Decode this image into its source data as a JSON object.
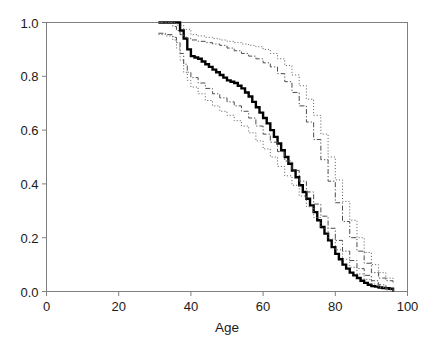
{
  "chart_data": {
    "type": "line",
    "title": "",
    "subtitle": "",
    "xlabel": "Age",
    "ylabel": "",
    "xlim": [
      0,
      100
    ],
    "ylim": [
      0.0,
      1.0
    ],
    "xticks": [
      "0",
      "20",
      "40",
      "60",
      "80",
      "100"
    ],
    "xtick_values": [
      0,
      20,
      40,
      60,
      80,
      100
    ],
    "yticks": [
      "0.0",
      "0.2",
      "0.4",
      "0.6",
      "0.8",
      "1.0"
    ],
    "ytick_values": [
      0.0,
      0.2,
      0.4,
      0.6,
      0.8,
      1.0
    ],
    "grid": false,
    "legend": "none",
    "frame": "box",
    "step_type": "post",
    "colors": {
      "axis": "#808080",
      "estimate": "#000000",
      "band_inner": "#4d4d4d",
      "band_outer": "#666666",
      "background": "#ffffff",
      "text": "#1a1a1a"
    },
    "series": [
      {
        "name": "estimate",
        "style": "solid",
        "width": 2.4,
        "x": [
          31,
          36,
          37,
          38,
          39,
          40,
          41,
          42,
          43,
          44,
          45,
          46,
          47,
          48,
          49,
          50,
          51,
          52,
          53,
          54,
          55,
          56,
          57,
          58,
          59,
          60,
          61,
          62,
          63,
          64,
          65,
          66,
          67,
          68,
          69,
          70,
          71,
          72,
          73,
          74,
          75,
          76,
          77,
          78,
          79,
          80,
          81,
          82,
          83,
          84,
          85,
          86,
          87,
          88,
          89,
          90,
          91,
          92,
          93,
          94,
          95,
          96
        ],
        "y": [
          1.0,
          1.0,
          0.97,
          0.94,
          0.9,
          0.875,
          0.87,
          0.865,
          0.855,
          0.845,
          0.835,
          0.825,
          0.815,
          0.805,
          0.795,
          0.785,
          0.78,
          0.775,
          0.765,
          0.755,
          0.74,
          0.725,
          0.705,
          0.685,
          0.665,
          0.645,
          0.625,
          0.6,
          0.575,
          0.55,
          0.525,
          0.5,
          0.475,
          0.45,
          0.425,
          0.395,
          0.37,
          0.345,
          0.32,
          0.295,
          0.265,
          0.24,
          0.215,
          0.19,
          0.165,
          0.14,
          0.12,
          0.1,
          0.085,
          0.07,
          0.06,
          0.05,
          0.04,
          0.032,
          0.025,
          0.02,
          0.018,
          0.015,
          0.013,
          0.012,
          0.01,
          0.0
        ]
      },
      {
        "name": "upper-inner-band",
        "style": "dashdot",
        "width": 1.0,
        "x": [
          31,
          34,
          35,
          36,
          37,
          38,
          39,
          40,
          42,
          44,
          46,
          48,
          50,
          52,
          54,
          56,
          58,
          60,
          62,
          64,
          66,
          68,
          70,
          72,
          74,
          76,
          78,
          80,
          82,
          84,
          86,
          88,
          90,
          92,
          94,
          96
        ],
        "y": [
          1.0,
          1.0,
          0.985,
          0.97,
          0.955,
          0.945,
          0.94,
          0.935,
          0.93,
          0.925,
          0.92,
          0.915,
          0.905,
          0.895,
          0.885,
          0.875,
          0.865,
          0.85,
          0.835,
          0.81,
          0.78,
          0.74,
          0.69,
          0.63,
          0.565,
          0.49,
          0.41,
          0.33,
          0.26,
          0.2,
          0.15,
          0.105,
          0.07,
          0.05,
          0.04,
          0.03
        ]
      },
      {
        "name": "upper-outer-band",
        "style": "dotted",
        "width": 1.0,
        "x": [
          31,
          34,
          36,
          38,
          40,
          42,
          44,
          46,
          48,
          50,
          52,
          54,
          56,
          58,
          60,
          62,
          64,
          66,
          68,
          70,
          72,
          74,
          76,
          78,
          80,
          82,
          84,
          86,
          88,
          90,
          92,
          94,
          96
        ],
        "y": [
          1.0,
          1.0,
          0.99,
          0.975,
          0.955,
          0.95,
          0.945,
          0.94,
          0.935,
          0.93,
          0.925,
          0.92,
          0.915,
          0.91,
          0.9,
          0.885,
          0.865,
          0.84,
          0.805,
          0.765,
          0.715,
          0.655,
          0.585,
          0.5,
          0.415,
          0.335,
          0.265,
          0.2,
          0.145,
          0.1,
          0.07,
          0.05,
          0.04
        ]
      },
      {
        "name": "lower-inner-band",
        "style": "dashdot",
        "width": 1.0,
        "x": [
          31,
          33,
          35,
          36,
          37,
          38,
          39,
          40,
          42,
          44,
          46,
          48,
          50,
          52,
          54,
          56,
          58,
          60,
          62,
          64,
          66,
          68,
          70,
          72,
          74,
          76,
          78,
          80,
          82,
          84,
          86,
          88,
          90,
          92,
          94,
          96
        ],
        "y": [
          0.96,
          0.955,
          0.945,
          0.925,
          0.885,
          0.845,
          0.815,
          0.795,
          0.775,
          0.755,
          0.735,
          0.72,
          0.705,
          0.69,
          0.67,
          0.645,
          0.615,
          0.585,
          0.555,
          0.52,
          0.485,
          0.45,
          0.41,
          0.37,
          0.325,
          0.28,
          0.235,
          0.19,
          0.15,
          0.115,
          0.085,
          0.06,
          0.04,
          0.025,
          0.012,
          0.0
        ]
      },
      {
        "name": "lower-outer-band",
        "style": "dotted",
        "width": 1.0,
        "x": [
          31,
          33,
          35,
          36,
          37,
          38,
          39,
          40,
          42,
          44,
          46,
          48,
          50,
          52,
          54,
          56,
          58,
          60,
          62,
          64,
          66,
          68,
          70,
          72,
          74,
          76,
          78,
          80,
          82,
          84,
          86,
          88,
          90,
          92,
          94,
          96
        ],
        "y": [
          0.955,
          0.95,
          0.935,
          0.905,
          0.86,
          0.815,
          0.785,
          0.76,
          0.735,
          0.71,
          0.69,
          0.67,
          0.655,
          0.635,
          0.615,
          0.59,
          0.56,
          0.53,
          0.5,
          0.465,
          0.43,
          0.395,
          0.355,
          0.315,
          0.275,
          0.235,
          0.195,
          0.155,
          0.12,
          0.09,
          0.065,
          0.045,
          0.028,
          0.015,
          0.006,
          0.0
        ]
      }
    ]
  }
}
